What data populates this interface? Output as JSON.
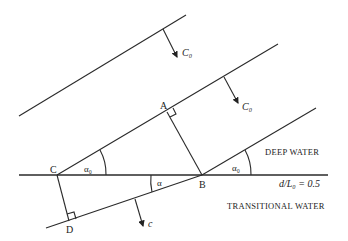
{
  "diagram": {
    "points": {
      "A": "A",
      "B": "B",
      "C": "C",
      "D": "D"
    },
    "angles": {
      "alpha0_left": "α₀",
      "alpha0_right": "α₀",
      "alpha": "α"
    },
    "velocities": {
      "c0_top": "C₀",
      "c0_middle": "C₀",
      "c": "c"
    },
    "regions": {
      "deep": "DEEP WATER",
      "transitional": "TRANSITIONAL WATER"
    },
    "boundary_label": "d/L₀ = 0.5"
  }
}
